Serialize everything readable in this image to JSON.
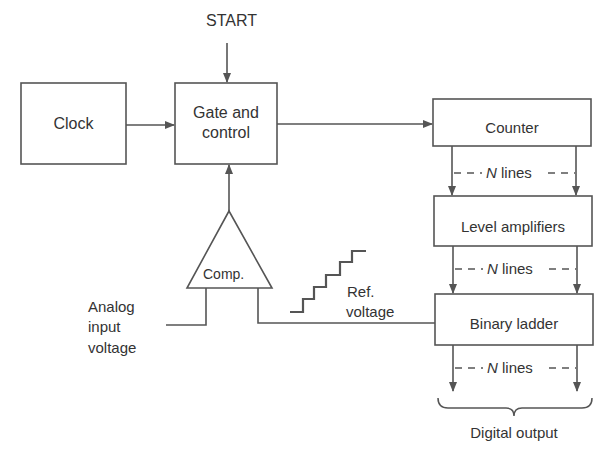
{
  "diagram": {
    "type": "block-diagram",
    "start_label": "START",
    "blocks": {
      "clock": "Clock",
      "gate_line1": "Gate and",
      "gate_line2": "control",
      "counter": "Counter",
      "level_amplifiers": "Level amplifiers",
      "binary_ladder": "Binary ladder",
      "comparator": "Comp."
    },
    "labels": {
      "n_lines_italic": "N",
      "n_lines_text": " lines",
      "analog_line1": "Analog",
      "analog_line2": "input",
      "analog_line3": "voltage",
      "ref_line1": "Ref.",
      "ref_line2": "voltage",
      "digital_output": "Digital output"
    },
    "colors": {
      "stroke": "#555555",
      "text": "#333333",
      "background": "#ffffff"
    }
  }
}
